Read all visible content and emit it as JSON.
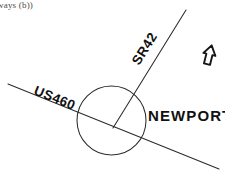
{
  "figure": {
    "caption_fragment": "ways  (b))"
  },
  "map": {
    "background_color": "#ffffff",
    "ink_color": "#2b2b2b",
    "labels": {
      "sr42": "SR42",
      "us460": "US460",
      "place": "NEWPORT"
    },
    "north_arrow": {
      "name": "north-arrow",
      "description": "hollow outline arrow pointing up"
    },
    "features": {
      "roundabout": "traffic circle",
      "road_primary": "US460 highway",
      "road_secondary": "SR42 state route"
    }
  }
}
